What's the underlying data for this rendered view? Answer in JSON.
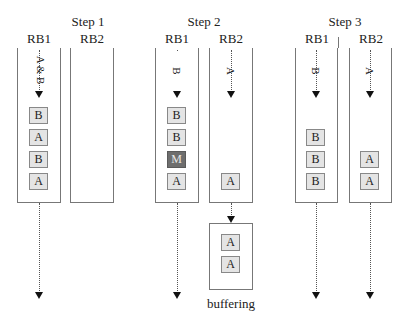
{
  "steps": [
    {
      "title": "Step 1",
      "rb1": {
        "label": "RB1",
        "flow": "A & B",
        "blocks": [
          "B",
          "A",
          "B",
          "A"
        ]
      },
      "rb2": {
        "label": "RB2",
        "flow": "",
        "blocks": []
      }
    },
    {
      "title": "Step 2",
      "rb1": {
        "label": "RB1",
        "flow": "B",
        "blocks": [
          "B",
          "B",
          "M",
          "A"
        ]
      },
      "rb2": {
        "label": "RB2",
        "flow": "A",
        "blocks": [
          "A"
        ]
      },
      "buffer": {
        "label": "buffering",
        "blocks": [
          "A",
          "A"
        ]
      }
    },
    {
      "title": "Step 3",
      "rb1": {
        "label": "RB1",
        "flow": "B",
        "blocks": [
          "B",
          "B",
          "B"
        ]
      },
      "rb2": {
        "label": "RB2",
        "flow": "A",
        "blocks": [
          "A",
          "A"
        ]
      }
    }
  ],
  "colors": {
    "block_fill": "#e4e4e4",
    "marked_block_fill": "#6e6e6e",
    "border": "#777777"
  }
}
